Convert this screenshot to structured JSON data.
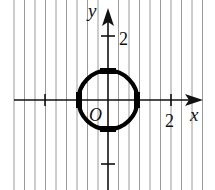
{
  "figure": {
    "type": "coordinate-plane",
    "axes": {
      "x_label": "x",
      "y_label": "y",
      "origin_label": "O"
    },
    "ticks": {
      "x": [
        {
          "value": -2,
          "label": ""
        },
        {
          "value": 2,
          "label": "2"
        }
      ],
      "y": [
        {
          "value": 2,
          "label": "2"
        },
        {
          "value": -2,
          "label": ""
        }
      ]
    },
    "circle": {
      "center": [
        0,
        0
      ],
      "radius": 1,
      "highlighted_points": [
        [
          1,
          0
        ],
        [
          0,
          1
        ],
        [
          -1,
          0
        ],
        [
          0,
          -1
        ]
      ]
    },
    "hatching": {
      "style": "vertical-lines",
      "color": "#9a9a9a"
    },
    "colors": {
      "axis": "#111111",
      "circle": "#000000",
      "background": "#ffffff"
    }
  }
}
